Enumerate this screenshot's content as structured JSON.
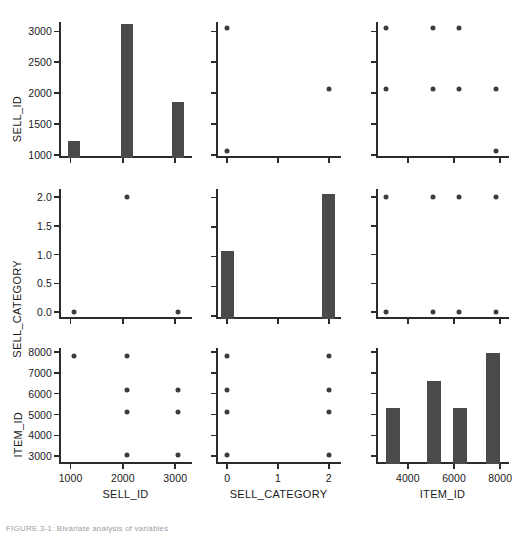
{
  "figure": {
    "caption": "FIGURE 3-1:  Bivariate analysis of variables",
    "variables": [
      "SELL_ID",
      "SELL_CATEGORY",
      "ITEM_ID"
    ],
    "marker_color": "#4a4a4a",
    "axis_color": "#2b2b2b",
    "background": "#ffffff"
  },
  "axes": {
    "SELL_ID": {
      "label": "SELL_ID",
      "ticks": [
        1000,
        1500,
        2000,
        2500,
        3000
      ],
      "tick_labels": [
        "1000",
        "1500",
        "2000",
        "2500",
        "3000"
      ],
      "xticks": [
        1000,
        2000,
        3000
      ],
      "xtick_labels": [
        "1000",
        "2000",
        "3000"
      ],
      "lim": [
        780,
        3320
      ]
    },
    "SELL_CATEGORY": {
      "label": "SELL_CATEGORY",
      "ticks": [
        0.0,
        0.5,
        1.0,
        1.5,
        2.0
      ],
      "tick_labels": [
        "0.0",
        "0.5",
        "1.0",
        "1.5",
        "2.0"
      ],
      "xticks": [
        0,
        1,
        2
      ],
      "xtick_labels": [
        "0",
        "1",
        "2"
      ],
      "lim": [
        -0.22,
        2.24
      ]
    },
    "ITEM_ID": {
      "label": "ITEM_ID",
      "ticks": [
        3000,
        4000,
        5000,
        6000,
        7000,
        8000
      ],
      "tick_labels": [
        "3000",
        "4000",
        "5000",
        "6000",
        "7000",
        "8000"
      ],
      "xticks": [
        4000,
        6000,
        8000
      ],
      "xtick_labels": [
        "4000",
        "6000",
        "8000"
      ],
      "lim": [
        2620,
        8380
      ]
    }
  },
  "chart_data": {
    "type": "scatter",
    "title": "",
    "layout": "pair-plot matrix 3x3",
    "grid": false,
    "legend": false,
    "variables": [
      "SELL_ID",
      "SELL_CATEGORY",
      "ITEM_ID"
    ],
    "panels": [
      {
        "row": 0,
        "col": 0,
        "kind": "bar",
        "xlabel": "SELL_ID",
        "ylabel": "SELL_ID",
        "xlim": [
          780,
          3320
        ],
        "ylim": [
          950,
          3150
        ],
        "categories": [
          1070,
          2070,
          3050
        ],
        "values": [
          1220,
          3110,
          1860
        ]
      },
      {
        "row": 0,
        "col": 1,
        "kind": "scatter",
        "xlabel": "SELL_CATEGORY",
        "ylabel": "SELL_ID",
        "xlim": [
          -0.22,
          2.24
        ],
        "ylim": [
          950,
          3150
        ],
        "x": [
          0,
          0,
          2
        ],
        "y": [
          3050,
          1070,
          2070
        ]
      },
      {
        "row": 0,
        "col": 2,
        "kind": "scatter",
        "xlabel": "ITEM_ID",
        "ylabel": "SELL_ID",
        "xlim": [
          2620,
          8380
        ],
        "ylim": [
          950,
          3150
        ],
        "x": [
          3050,
          5100,
          6200,
          3050,
          5100,
          6200,
          7800,
          7800
        ],
        "y": [
          3050,
          3050,
          3050,
          2070,
          2070,
          2070,
          2070,
          1070
        ]
      },
      {
        "row": 1,
        "col": 0,
        "kind": "scatter",
        "xlabel": "SELL_ID",
        "ylabel": "SELL_CATEGORY",
        "xlim": [
          780,
          3320
        ],
        "ylim": [
          -0.12,
          2.14
        ],
        "x": [
          1070,
          2070,
          3050
        ],
        "y": [
          0,
          2,
          0
        ]
      },
      {
        "row": 1,
        "col": 1,
        "kind": "bar",
        "xlabel": "SELL_CATEGORY",
        "ylabel": "SELL_CATEGORY",
        "xlim": [
          -0.22,
          2.24
        ],
        "ylim": [
          -0.05,
          2.14
        ],
        "categories": [
          0,
          2
        ],
        "values": [
          1.1,
          2.05
        ]
      },
      {
        "row": 1,
        "col": 2,
        "kind": "scatter",
        "xlabel": "ITEM_ID",
        "ylabel": "SELL_CATEGORY",
        "xlim": [
          2620,
          8380
        ],
        "ylim": [
          -0.12,
          2.14
        ],
        "x": [
          3050,
          5100,
          6200,
          7800,
          3050,
          5100,
          6200,
          7800
        ],
        "y": [
          2,
          2,
          2,
          2,
          0,
          0,
          0,
          0
        ]
      },
      {
        "row": 2,
        "col": 0,
        "kind": "scatter",
        "xlabel": "SELL_ID",
        "ylabel": "ITEM_ID",
        "xlim": [
          780,
          3320
        ],
        "ylim": [
          2620,
          8200
        ],
        "x": [
          1070,
          2070,
          2070,
          2070,
          2070,
          3050,
          3050,
          3050
        ],
        "y": [
          7800,
          7800,
          6200,
          5100,
          3050,
          6200,
          5100,
          3050
        ]
      },
      {
        "row": 2,
        "col": 1,
        "kind": "scatter",
        "xlabel": "SELL_CATEGORY",
        "ylabel": "ITEM_ID",
        "xlim": [
          -0.22,
          2.24
        ],
        "ylim": [
          2620,
          8200
        ],
        "x": [
          0,
          0,
          0,
          0,
          2,
          2,
          2,
          2
        ],
        "y": [
          7800,
          6200,
          5100,
          3050,
          7800,
          6200,
          5100,
          3050
        ]
      },
      {
        "row": 2,
        "col": 2,
        "kind": "bar",
        "xlabel": "ITEM_ID",
        "ylabel": "ITEM_ID",
        "xlim": [
          2620,
          8380
        ],
        "ylim": [
          2620,
          8200
        ],
        "categories": [
          3350,
          5150,
          6250,
          7700
        ],
        "values": [
          5300,
          6600,
          5320,
          7960
        ]
      }
    ]
  }
}
